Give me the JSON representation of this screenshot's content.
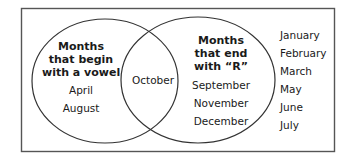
{
  "diagram": {
    "type": "venn",
    "sets": [
      {
        "title_lines": [
          "Months",
          "that begin",
          "with a vowel"
        ],
        "only_items": [
          "April",
          "August"
        ]
      },
      {
        "title_lines": [
          "Months",
          "that end",
          "with “R”"
        ],
        "only_items": [
          "September",
          "November",
          "December"
        ]
      }
    ],
    "intersection_items": [
      "October"
    ],
    "outside_items": [
      "January",
      "February",
      "March",
      "May",
      "June",
      "July"
    ],
    "colors": {
      "stroke": "#333333",
      "frame": "#555555",
      "text": "#1a1a1a",
      "background": "#ffffff"
    }
  }
}
